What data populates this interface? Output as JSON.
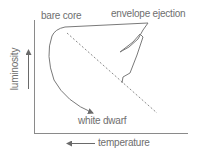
{
  "diagram": {
    "type": "hr-diagram-post-agb-evolution",
    "labels": {
      "bare_core": "bare core",
      "envelope_ejection": "envelope ejection",
      "white_dwarf": "white dwarf",
      "x_axis": "temperature",
      "y_axis": "luminosity"
    },
    "axis_direction": {
      "x_arrow": "left",
      "y_arrow": "up"
    },
    "elements": [
      "evolutionary-track",
      "main-sequence-dashed-line",
      "axes"
    ],
    "colors": {
      "line": "#7a7a7a",
      "text": "#6e6e6e",
      "background": "#ffffff"
    }
  }
}
